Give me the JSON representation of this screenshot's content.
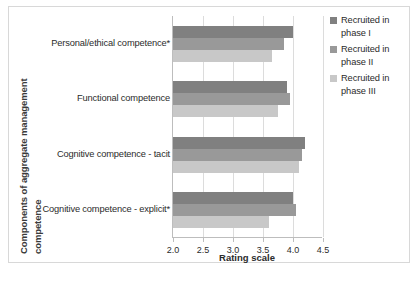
{
  "chart_data": {
    "type": "bar",
    "orientation": "horizontal",
    "title": "",
    "xlabel": "Rating scale",
    "ylabel": "Components of aggregate management competence",
    "xlim": [
      2.0,
      4.5
    ],
    "xticks": [
      "2.0",
      "2.5",
      "3.0",
      "3.5",
      "4.0",
      "4.5"
    ],
    "xtick_values": [
      2.0,
      2.5,
      3.0,
      3.5,
      4.0,
      4.5
    ],
    "grid": true,
    "legend_position": "right",
    "categories": [
      "Personal/ethical competence*",
      "Functional competence",
      "Cognitive competence - tacit",
      "Cognitive competence - explicit*"
    ],
    "series": [
      {
        "name": "Recruited in phase I",
        "color": "#808080",
        "values": [
          4.0,
          3.9,
          4.2,
          4.0
        ]
      },
      {
        "name": "Recruited in phase II",
        "color": "#999999",
        "values": [
          3.85,
          3.95,
          4.15,
          4.05
        ]
      },
      {
        "name": "Recruited in phase III",
        "color": "#c8c8c8",
        "values": [
          3.65,
          3.75,
          4.1,
          3.6
        ]
      }
    ]
  },
  "yaxis": {
    "line1": "Components of aggregate management",
    "line2": "competence"
  },
  "legend": {
    "items": [
      {
        "label": "Recruited in phase I"
      },
      {
        "label": "Recruited in phase II"
      },
      {
        "label": "Recruited in phase III"
      }
    ]
  },
  "caption": {
    "text": ""
  }
}
